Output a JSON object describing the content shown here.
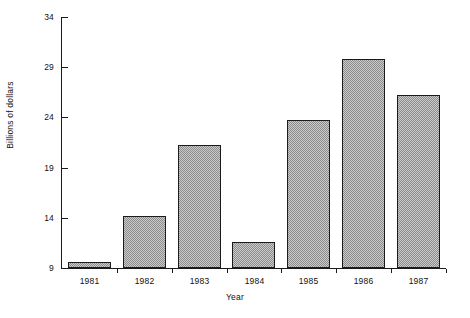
{
  "chart_data": {
    "type": "bar",
    "title": "",
    "subtitle": "",
    "xlabel": "Year",
    "ylabel": "Billions of dollars",
    "categories": [
      "1981",
      "1982",
      "1983",
      "1984",
      "1985",
      "1986",
      "1987"
    ],
    "values": [
      9.6,
      14.2,
      21.3,
      11.6,
      23.7,
      29.8,
      26.2
    ],
    "ylim": [
      9,
      34
    ],
    "yticks": [
      9,
      14,
      19,
      24,
      29,
      34
    ],
    "ytick_labels": [
      "9",
      "14",
      "19",
      "24",
      "29",
      "34"
    ],
    "xtick_labels": [
      "1981",
      "1982",
      "1983",
      "1984",
      "1985",
      "1986",
      "1987"
    ],
    "grid": false,
    "legend": null,
    "legend_position": "none",
    "series": [
      {
        "name": "Billions of dollars",
        "values": [
          9.6,
          14.2,
          21.3,
          11.6,
          23.7,
          29.8,
          26.2
        ]
      }
    ],
    "bar_fill": "checkered-gray-dither",
    "bar_edge_color": "#1b1b1b",
    "axis_color": "#1a1a1a",
    "background_color": "#ffffff"
  },
  "figure": {
    "caption": ""
  }
}
